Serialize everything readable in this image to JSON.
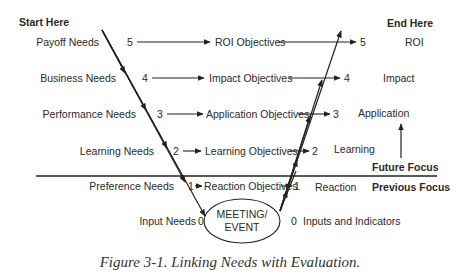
{
  "diagram": {
    "start_label": "Start Here",
    "end_label": "End Here",
    "future_focus": "Future Focus",
    "previous_focus": "Previous Focus",
    "center_node": {
      "line1": "MEETING/",
      "line2": "EVENT"
    },
    "levels": [
      {
        "level": "5",
        "need": "Payoff Needs",
        "objective": "ROI Objectives",
        "evaluation": "ROI"
      },
      {
        "level": "4",
        "need": "Business Needs",
        "objective": "Impact Objectives",
        "evaluation": "Impact"
      },
      {
        "level": "3",
        "need": "Performance Needs",
        "objective": "Application Objectives",
        "evaluation": "Application"
      },
      {
        "level": "2",
        "need": "Learning Needs",
        "objective": "Learning Objectives",
        "evaluation": "Learning"
      },
      {
        "level": "1",
        "need": "Preference Needs",
        "objective": "Reaction Objectives",
        "evaluation": "Reaction"
      },
      {
        "level": "0",
        "need": "Input Needs",
        "objective": "",
        "evaluation": "Inputs and Indicators"
      }
    ],
    "caption": "Figure 3-1. Linking Needs with Evaluation."
  }
}
